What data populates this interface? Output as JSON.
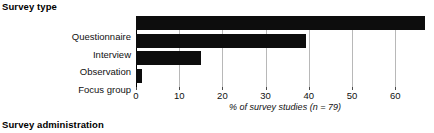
{
  "headings": {
    "top": "Survey type",
    "bottom": "Survey administration"
  },
  "chart_data": {
    "type": "bar",
    "orientation": "horizontal",
    "title": "Survey type",
    "categories": [
      "Questionnaire",
      "Interview",
      "Observation",
      "Focus group"
    ],
    "values": [
      67,
      39.4,
      15,
      1.3
    ],
    "xlabel": "% of survey studies (n = 79)",
    "ylabel": "",
    "xlim": [
      0,
      69
    ],
    "xticks": [
      0,
      10,
      20,
      30,
      40,
      50,
      60
    ],
    "xtick_labels": [
      "0",
      "10",
      "20",
      "30",
      "40",
      "50",
      "60"
    ],
    "grid": true,
    "legend": false,
    "bar_color": "#0d0d0d",
    "grid_color": "#b8b8b8",
    "n": 79
  }
}
